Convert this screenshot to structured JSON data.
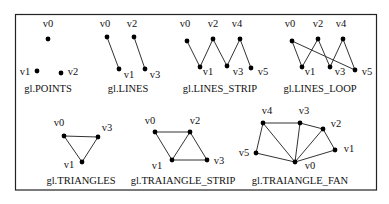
{
  "colors": {
    "stroke": "#333333",
    "dot": "#000000",
    "border": "#222222"
  },
  "panels": [
    {
      "id": "points",
      "caption": "gl.POINTS",
      "caption_pos": [
        48,
        92
      ],
      "vertices": [
        {
          "label": "v0",
          "x": 48,
          "y": 39,
          "lx": 48,
          "ly": 27
        },
        {
          "label": "v1",
          "x": 37,
          "y": 71,
          "lx": 25,
          "ly": 75
        },
        {
          "label": "v2",
          "x": 61,
          "y": 73,
          "lx": 73,
          "ly": 75
        }
      ],
      "edges": []
    },
    {
      "id": "lines",
      "caption": "gl.LINES",
      "caption_pos": [
        128,
        92
      ],
      "vertices": [
        {
          "label": "v0",
          "x": 107,
          "y": 37,
          "lx": 105,
          "ly": 27
        },
        {
          "label": "v1",
          "x": 119,
          "y": 69,
          "lx": 129,
          "ly": 78
        },
        {
          "label": "v2",
          "x": 134,
          "y": 37,
          "lx": 132,
          "ly": 27
        },
        {
          "label": "v3",
          "x": 145,
          "y": 69,
          "lx": 155,
          "ly": 78
        }
      ],
      "edges": [
        [
          0,
          1
        ],
        [
          2,
          3
        ]
      ]
    },
    {
      "id": "line_strip",
      "caption": "gl.LINES_STRIP",
      "caption_pos": [
        220,
        92
      ],
      "vertices": [
        {
          "label": "v0",
          "x": 187,
          "y": 41,
          "lx": 185,
          "ly": 27
        },
        {
          "label": "v1",
          "x": 200,
          "y": 67,
          "lx": 208,
          "ly": 75
        },
        {
          "label": "v2",
          "x": 213,
          "y": 39,
          "lx": 213,
          "ly": 27
        },
        {
          "label": "v3",
          "x": 227,
          "y": 66,
          "lx": 238,
          "ly": 75
        },
        {
          "label": "v4",
          "x": 240,
          "y": 39,
          "lx": 237,
          "ly": 27
        },
        {
          "label": "v5",
          "x": 251,
          "y": 68,
          "lx": 263,
          "ly": 75
        }
      ],
      "edges": [
        [
          0,
          1
        ],
        [
          1,
          2
        ],
        [
          2,
          3
        ],
        [
          3,
          4
        ],
        [
          4,
          5
        ]
      ]
    },
    {
      "id": "line_loop",
      "caption": "gl.LINES_LOOP",
      "caption_pos": [
        320,
        92
      ],
      "vertices": [
        {
          "label": "v0",
          "x": 292,
          "y": 41,
          "lx": 290,
          "ly": 27
        },
        {
          "label": "v1",
          "x": 302,
          "y": 67,
          "lx": 310,
          "ly": 75
        },
        {
          "label": "v2",
          "x": 318,
          "y": 39,
          "lx": 318,
          "ly": 27
        },
        {
          "label": "v3",
          "x": 330,
          "y": 67,
          "lx": 340,
          "ly": 75
        },
        {
          "label": "v4",
          "x": 343,
          "y": 39,
          "lx": 341,
          "ly": 27
        },
        {
          "label": "v5",
          "x": 355,
          "y": 70,
          "lx": 367,
          "ly": 75
        }
      ],
      "edges": [
        [
          0,
          1
        ],
        [
          1,
          2
        ],
        [
          2,
          3
        ],
        [
          3,
          4
        ],
        [
          4,
          5
        ],
        [
          5,
          0
        ]
      ]
    },
    {
      "id": "triangles",
      "caption": "gl.TRIANGLES",
      "caption_pos": [
        81,
        184
      ],
      "vertices": [
        {
          "label": "v0",
          "x": 64,
          "y": 136,
          "lx": 59,
          "ly": 126
        },
        {
          "label": "v1",
          "x": 82,
          "y": 162,
          "lx": 69,
          "ly": 168
        },
        {
          "label": "v3",
          "x": 98,
          "y": 137,
          "lx": 107,
          "ly": 131
        }
      ],
      "edges": [
        [
          0,
          1
        ],
        [
          1,
          2
        ],
        [
          2,
          0
        ]
      ]
    },
    {
      "id": "triangle_strip",
      "caption": "gl.TRAIANGLE_STRIP",
      "caption_pos": [
        183,
        184
      ],
      "vertices": [
        {
          "label": "v0",
          "x": 155,
          "y": 132,
          "lx": 150,
          "ly": 124
        },
        {
          "label": "v1",
          "x": 172,
          "y": 160,
          "lx": 157,
          "ly": 169
        },
        {
          "label": "v2",
          "x": 190,
          "y": 132,
          "lx": 195,
          "ly": 124
        },
        {
          "label": "v3",
          "x": 207,
          "y": 160,
          "lx": 219,
          "ly": 164
        }
      ],
      "edges": [
        [
          0,
          2
        ],
        [
          0,
          1
        ],
        [
          1,
          2
        ],
        [
          1,
          3
        ],
        [
          2,
          3
        ]
      ]
    },
    {
      "id": "triangle_fan",
      "caption": "gl.TRAIANGLE_FAN",
      "caption_pos": [
        300,
        184
      ],
      "vertices": [
        {
          "label": "v0",
          "x": 295,
          "y": 162,
          "lx": 310,
          "ly": 169
        },
        {
          "label": "v1",
          "x": 335,
          "y": 150,
          "lx": 349,
          "ly": 152
        },
        {
          "label": "v2",
          "x": 323,
          "y": 129,
          "lx": 336,
          "ly": 127
        },
        {
          "label": "v3",
          "x": 300,
          "y": 123,
          "lx": 304,
          "ly": 114
        },
        {
          "label": "v4",
          "x": 263,
          "y": 123,
          "lx": 267,
          "ly": 114
        },
        {
          "label": "v5",
          "x": 256,
          "y": 153,
          "lx": 244,
          "ly": 156
        }
      ],
      "edges": [
        [
          0,
          1
        ],
        [
          1,
          2
        ],
        [
          2,
          3
        ],
        [
          3,
          4
        ],
        [
          4,
          5
        ],
        [
          5,
          0
        ],
        [
          0,
          2
        ],
        [
          0,
          3
        ],
        [
          0,
          4
        ]
      ]
    }
  ]
}
